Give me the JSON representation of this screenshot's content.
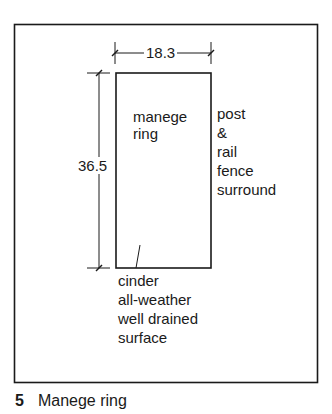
{
  "figure": {
    "number": "5",
    "caption": "Manege ring"
  },
  "diagram": {
    "width_dimension": "18.3",
    "length_dimension": "36.5",
    "ring_label_line1": "manege",
    "ring_label_line2": "ring",
    "fence_label": [
      "post",
      "&",
      "rail",
      "fence",
      "surround"
    ],
    "surface_label": [
      "cinder",
      "all-weather",
      "well drained",
      "surface"
    ],
    "line_color": "#1a1a1a"
  }
}
